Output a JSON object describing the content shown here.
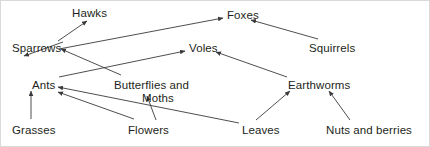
{
  "diagram": {
    "type": "food-web",
    "title": "",
    "background_color": "#ffffff",
    "line_color": "#3a3a3a",
    "text_color": "#231f20",
    "nodes": [
      {
        "id": "hawks",
        "label": "Hawks",
        "x": 71,
        "y": 6,
        "trophic": "tertiary-consumer"
      },
      {
        "id": "foxes",
        "label": "Foxes",
        "x": 226,
        "y": 8,
        "trophic": "tertiary-consumer"
      },
      {
        "id": "sparrows",
        "label": "Sparrows",
        "x": 11,
        "y": 41,
        "trophic": "secondary-consumer"
      },
      {
        "id": "voles",
        "label": "Voles",
        "x": 188,
        "y": 41,
        "trophic": "secondary-consumer"
      },
      {
        "id": "squirrels",
        "label": "Squirrels",
        "x": 308,
        "y": 41,
        "trophic": "primary-consumer"
      },
      {
        "id": "ants",
        "label": "Ants",
        "x": 31,
        "y": 78,
        "trophic": "primary-consumer"
      },
      {
        "id": "butterflies",
        "label": "Butterflies and",
        "x": 113,
        "y": 78,
        "trophic": "primary-consumer"
      },
      {
        "id": "butterflies_line2",
        "label": "Moths",
        "x": 141,
        "y": 91,
        "trophic": "primary-consumer"
      },
      {
        "id": "earthworms",
        "label": "Earthworms",
        "x": 287,
        "y": 78,
        "trophic": "decomposer"
      },
      {
        "id": "grasses",
        "label": "Grasses",
        "x": 11,
        "y": 123,
        "trophic": "producer"
      },
      {
        "id": "flowers",
        "label": "Flowers",
        "x": 127,
        "y": 123,
        "trophic": "producer"
      },
      {
        "id": "leaves",
        "label": "Leaves",
        "x": 241,
        "y": 123,
        "trophic": "producer"
      },
      {
        "id": "nuts_berries",
        "label": "Nuts and berries",
        "x": 325,
        "y": 123,
        "trophic": "producer"
      }
    ],
    "edges": [
      {
        "from": "sparrows",
        "to": "hawks",
        "x1": 57,
        "y1": 40,
        "x2": 86,
        "y2": 20
      },
      {
        "from": "sparrows",
        "to": "foxes",
        "x1": 58,
        "y1": 48,
        "x2": 222,
        "y2": 17
      },
      {
        "from": "squirrels",
        "to": "foxes",
        "x1": 317,
        "y1": 38,
        "x2": 250,
        "y2": 19
      },
      {
        "from": "ants",
        "to": "sparrows",
        "x1": 62,
        "y1": 41,
        "x2": 23,
        "y2": 55
      },
      {
        "from": "butterflies",
        "to": "sparrows",
        "x1": 120,
        "y1": 74,
        "x2": 60,
        "y2": 48
      },
      {
        "from": "ants",
        "to": "voles",
        "x1": 58,
        "y1": 76,
        "x2": 184,
        "y2": 50
      },
      {
        "from": "earthworms",
        "to": "voles",
        "x1": 286,
        "y1": 76,
        "x2": 215,
        "y2": 51
      },
      {
        "from": "grasses",
        "to": "ants",
        "x1": 30,
        "y1": 118,
        "x2": 30,
        "y2": 90
      },
      {
        "from": "flowers",
        "to": "ants",
        "x1": 133,
        "y1": 118,
        "x2": 57,
        "y2": 91
      },
      {
        "from": "leaves",
        "to": "ants",
        "x1": 238,
        "y1": 122,
        "x2": 57,
        "y2": 86
      },
      {
        "from": "flowers",
        "to": "butterflies",
        "x1": 155,
        "y1": 119,
        "x2": 146,
        "y2": 95
      },
      {
        "from": "leaves",
        "to": "earthworms",
        "x1": 255,
        "y1": 119,
        "x2": 289,
        "y2": 90
      },
      {
        "from": "nuts_berries",
        "to": "squirrels",
        "x1": 349,
        "y1": 119,
        "x2": 328,
        "y2": 90
      }
    ]
  }
}
